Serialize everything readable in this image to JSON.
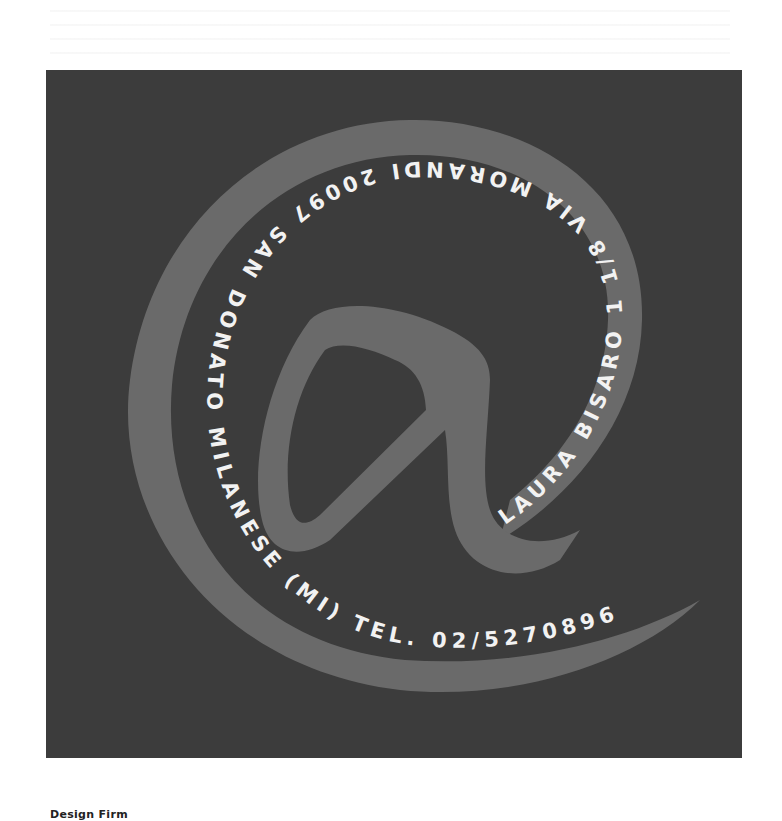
{
  "logo": {
    "symbol": "@",
    "background_color": "#3c3c3c",
    "stroke_color": "#6a6a6a",
    "text_color": "#f2f2f2",
    "curved_text": "LAURA BISARO  1 1/8 VIA MORANDI 20097 SAN DONATO MILANESE (MI)  TEL. 02/5270896",
    "name": "LAURA BISARO",
    "address": "1 1/8 VIA MORANDI 20097 SAN DONATO MILANESE (MI)",
    "phone": "TEL. 02/5270896"
  },
  "caption": {
    "label": "Design Firm"
  }
}
